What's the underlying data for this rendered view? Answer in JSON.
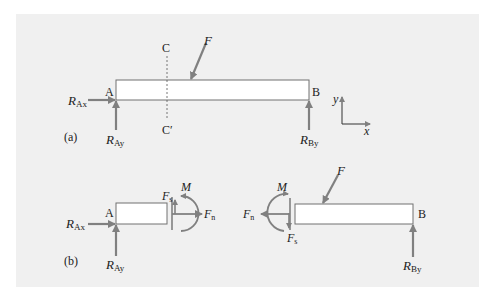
{
  "figure": {
    "background_color": "#f0f0f0",
    "beam_fill": "#ffffff",
    "line_color": "#707070",
    "arrow_color": "#808080",
    "text_color": "#222222"
  },
  "part_a": {
    "label": "(a)",
    "point_a": "A",
    "point_b": "B",
    "section_top": "C",
    "section_bottom": "C′",
    "force": "F",
    "reactions": {
      "ax": {
        "main": "R",
        "sub": "Ax"
      },
      "ay": {
        "main": "R",
        "sub": "Ay"
      },
      "by": {
        "main": "R",
        "sub": "By"
      }
    },
    "axes": {
      "y": "y",
      "x": "x"
    }
  },
  "part_b": {
    "label": "(b)",
    "left": {
      "point_a": "A",
      "shear": {
        "main": "F",
        "sub": "s"
      },
      "moment": "M",
      "normal": {
        "main": "F",
        "sub": "n"
      },
      "reactions": {
        "ax": {
          "main": "R",
          "sub": "Ax"
        },
        "ay": {
          "main": "R",
          "sub": "Ay"
        }
      }
    },
    "right": {
      "point_b": "B",
      "force": "F",
      "shear": {
        "main": "F",
        "sub": "s"
      },
      "moment": "M",
      "normal": {
        "main": "F",
        "sub": "n"
      },
      "reactions": {
        "by": {
          "main": "R",
          "sub": "By"
        }
      }
    }
  }
}
